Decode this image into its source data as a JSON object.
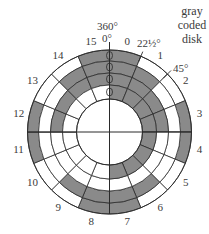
{
  "title": {
    "lines": [
      "gray",
      "coded",
      "disk"
    ]
  },
  "angle_labels": {
    "top_360": "360°",
    "top_0": "0°",
    "a22": "22½°",
    "a45": "45°"
  },
  "colors": {
    "filled": "#8a8a8a",
    "empty": "#ffffff",
    "stroke": "#2a2a2a"
  },
  "geometry": {
    "cx": 109.5,
    "cy": 132,
    "radii": [
      82,
      71,
      59,
      47,
      33
    ]
  },
  "sectors": [
    {
      "label": "0",
      "bits": [
        1,
        1,
        1,
        1
      ]
    },
    {
      "label": "1",
      "bits": [
        0,
        1,
        1,
        1
      ]
    },
    {
      "label": "2",
      "bits": [
        0,
        0,
        1,
        1
      ]
    },
    {
      "label": "3",
      "bits": [
        1,
        0,
        1,
        1
      ]
    },
    {
      "label": "4",
      "bits": [
        1,
        0,
        0,
        1
      ]
    },
    {
      "label": "5",
      "bits": [
        0,
        0,
        0,
        1
      ]
    },
    {
      "label": "6",
      "bits": [
        0,
        1,
        0,
        1
      ]
    },
    {
      "label": "7",
      "bits": [
        1,
        1,
        0,
        1
      ]
    },
    {
      "label": "8",
      "bits": [
        1,
        1,
        0,
        0
      ]
    },
    {
      "label": "9",
      "bits": [
        0,
        1,
        0,
        0
      ]
    },
    {
      "label": "10",
      "bits": [
        0,
        0,
        0,
        0
      ]
    },
    {
      "label": "11",
      "bits": [
        1,
        0,
        0,
        0
      ]
    },
    {
      "label": "12",
      "bits": [
        1,
        0,
        1,
        0
      ]
    },
    {
      "label": "13",
      "bits": [
        0,
        0,
        1,
        0
      ]
    },
    {
      "label": "14",
      "bits": [
        0,
        1,
        1,
        0
      ]
    },
    {
      "label": "15",
      "bits": [
        1,
        1,
        1,
        0
      ]
    }
  ]
}
